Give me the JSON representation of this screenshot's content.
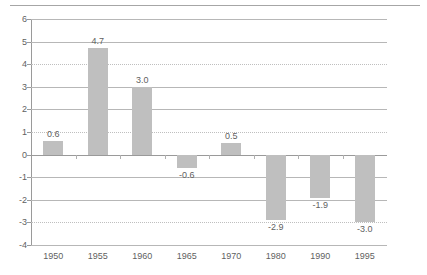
{
  "chart_data": {
    "type": "bar",
    "title": "",
    "subtitle": "",
    "xlabel": "",
    "ylabel": "",
    "categories": [
      "1950",
      "1955",
      "1960",
      "1965",
      "1970",
      "1980",
      "1990",
      "1995"
    ],
    "values": [
      0.6,
      4.7,
      3.0,
      -0.6,
      0.5,
      -2.9,
      -1.9,
      -3.0
    ],
    "data_labels": [
      "0.6",
      "4.7",
      "3.0",
      "-0.6",
      "0.5",
      "-2.9",
      "-1.9",
      "-3.0"
    ],
    "ylim": [
      -4,
      6
    ],
    "ytick_step": 1,
    "ytick_labels": [
      "6",
      "5",
      "4",
      "3",
      "2",
      "1",
      "0",
      "-1",
      "-2",
      "-3",
      "-4"
    ],
    "ytick_values": [
      6,
      5,
      4,
      3,
      2,
      1,
      0,
      -1,
      -2,
      -3,
      -4
    ],
    "gridline_styles": {
      "6": "solid",
      "5": "solid",
      "4": "dotted",
      "3": "solid",
      "2": "solid",
      "1": "dotted",
      "0": "zero",
      "-1": "solid",
      "-2": "solid",
      "-3": "dotted",
      "-4": "solid"
    },
    "grid": true,
    "legend": false,
    "legend_position": "none",
    "series": [
      {
        "name": "",
        "values": [
          0.6,
          4.7,
          3.0,
          -0.6,
          0.5,
          -2.9,
          -1.9,
          -3.0
        ]
      }
    ],
    "colors": {
      "bar_fill": "#bfbfbf",
      "bar_pattern": "#d9d9d9",
      "gridline": "#b7b7b7",
      "axis": "#9a9a9a",
      "text": "#5f5f5f",
      "background": "#ffffff",
      "top_rule": "#a6a6a6"
    }
  }
}
